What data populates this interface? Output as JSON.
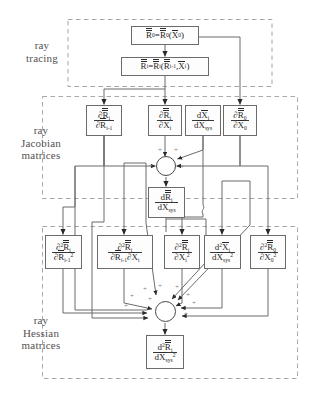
{
  "diagram": {
    "background_color": "#ffffff",
    "line_color": "#6d6a6b",
    "text_color": "#2b2829",
    "group_label_color": "#555152"
  },
  "groups": [
    {
      "id": "ray-tracing",
      "label": "ray\ntracing"
    },
    {
      "id": "ray-jacobian",
      "label": "ray\nJacobian\nmatrices"
    },
    {
      "id": "ray-hessian",
      "label": "ray\nHessian\nmatrices"
    }
  ],
  "ray_tracing": {
    "box_r0": {
      "lhs": "R",
      "lhs_sub": "0",
      "rhs": "R",
      "rhs_sub": "0",
      "arg": "X",
      "arg_sub": "0"
    },
    "box_ri": {
      "lhs": "R",
      "lhs_sub": "i",
      "rhs": "R",
      "rhs_sub": "i",
      "arg1": "R",
      "arg1_sub": "i-1",
      "arg2": "X",
      "arg2_sub": "i"
    }
  },
  "jacobian": {
    "b1": {
      "num": "∂R",
      "num_sub": "i",
      "den": "∂R",
      "den_sub": "i-1"
    },
    "b2": {
      "num": "∂R",
      "num_sub": "i",
      "den": "∂X",
      "den_sub": "i"
    },
    "b3": {
      "num": "dX",
      "num_sub": "i",
      "den": "dX",
      "den_sub": "sys"
    },
    "b4": {
      "num": "∂R",
      "num_sub": "0",
      "den": "∂X",
      "den_sub": "0"
    },
    "out": {
      "num": "dR",
      "num_sub": "i",
      "den": "dX",
      "den_sub": "sys"
    }
  },
  "hessian": {
    "h1": {
      "num": "∂",
      "num_sup": "2",
      "num_sym": "R",
      "num_sub": "i",
      "den": "∂R",
      "den_sub": "i-1",
      "den_sup": "2"
    },
    "h2": {
      "num": "∂",
      "num_sup": "2",
      "num_sym": "R",
      "num_sub": "i",
      "den1": "∂R",
      "den1_sub": "i-1",
      "den2": "∂X",
      "den2_sub": "i"
    },
    "h3": {
      "num": "∂",
      "num_sup": "2",
      "num_sym": "R",
      "num_sub": "i",
      "den": "∂X",
      "den_sub": "i",
      "den_sup": "2"
    },
    "h4": {
      "num": "d",
      "num_sup": "2",
      "num_sym": "X",
      "num_sub": "i",
      "den": "dX",
      "den_sub": "sys",
      "den_sup": "2"
    },
    "h5": {
      "num": "∂",
      "num_sup": "2",
      "num_sym": "R",
      "num_sub": "0",
      "den": "∂X",
      "den_sub": "0",
      "den_sup": "2"
    },
    "out": {
      "num": "d",
      "num_sup": "2",
      "num_sym": "R",
      "num_sub": "i",
      "den": "dX",
      "den_sub": "sys",
      "den_sup": "2"
    }
  },
  "operators": {
    "sum_symbol": "+",
    "jacobian_sum_plus_count": 4,
    "hessian_sum_plus_count": 9
  }
}
